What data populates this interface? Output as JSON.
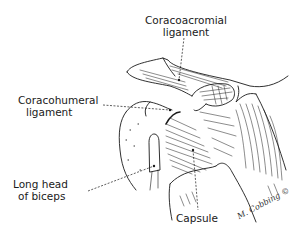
{
  "figure": {
    "labels": {
      "coracoacromial": {
        "line1": "Coracoacromial",
        "line2": "ligament"
      },
      "coracohumeral": {
        "line1": "Coracohumeral",
        "line2": "ligament"
      },
      "biceps": {
        "line1": "Long head",
        "line2": "of biceps"
      },
      "capsule": {
        "text": "Capsule"
      }
    },
    "signature": "M. Cobbing ©",
    "colors": {
      "ink": "#1a1a1a",
      "background": "#ffffff"
    }
  }
}
